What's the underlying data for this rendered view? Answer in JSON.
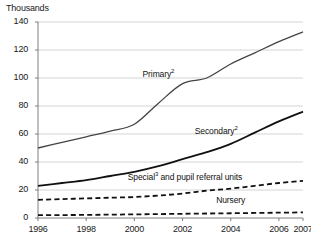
{
  "chart_data": {
    "type": "line",
    "title": "",
    "axis_note": "Thousands",
    "xlabel": "",
    "ylabel": "Thousands",
    "xlim": [
      1996,
      2007
    ],
    "ylim": [
      0,
      140
    ],
    "ytick_step": 20,
    "grid": true,
    "legend_position": "inline-annotations",
    "yticks": [
      "0",
      "20",
      "40",
      "60",
      "80",
      "100",
      "120",
      "140"
    ],
    "ytick_values": [
      0,
      20,
      40,
      60,
      80,
      100,
      120,
      140
    ],
    "xticks": [
      "1996",
      "1998",
      "2000",
      "2002",
      "2004",
      "2006",
      "2007"
    ],
    "xtick_values": [
      1996,
      1998,
      2000,
      2002,
      2004,
      2006,
      2007
    ],
    "x": [
      1996,
      1997,
      1998,
      1999,
      2000,
      2001,
      2002,
      2003,
      2004,
      2005,
      2006,
      2007
    ],
    "series": [
      {
        "name": "Primary",
        "label": "Primary",
        "footnote": "2",
        "style": "solid",
        "color": "#444444",
        "width": 1.3,
        "values": [
          50,
          54,
          58,
          62,
          67,
          82,
          96,
          100,
          110,
          118,
          126,
          133
        ]
      },
      {
        "name": "Secondary",
        "label": "Secondary",
        "footnote": "2",
        "style": "solid",
        "color": "#111111",
        "width": 1.8,
        "values": [
          23,
          25,
          27,
          30,
          33,
          37,
          42,
          47,
          53,
          61,
          69,
          76
        ]
      },
      {
        "name": "Special and pupil referral units",
        "label": "Special",
        "footnote": "3",
        "label_suffix": " and pupil referral units",
        "style": "dashed",
        "color": "#111111",
        "width": 1.8,
        "values": [
          13,
          13.5,
          14,
          14.5,
          15,
          16,
          17.5,
          19.5,
          21,
          23,
          25,
          26.5
        ]
      },
      {
        "name": "Nursery",
        "label": "Nursery",
        "footnote": "",
        "style": "dashed",
        "color": "#111111",
        "width": 1.8,
        "values": [
          2,
          2.1,
          2.2,
          2.4,
          2.6,
          2.8,
          3,
          3.2,
          3.4,
          3.6,
          3.8,
          4
        ]
      }
    ],
    "annotations": [
      {
        "text": "Primary",
        "footnote": "2",
        "x": 2001.0,
        "y": 103
      },
      {
        "text": "Secondary",
        "footnote": "2",
        "x": 2003.4,
        "y": 62
      },
      {
        "text": "Special",
        "footnote": "3",
        "suffix": " and pupil referral units",
        "x": 2002.1,
        "y": 29
      },
      {
        "text": "Nursery",
        "footnote": "",
        "x": 2004.0,
        "y": 12
      }
    ],
    "colors": {
      "grid": "#c9c9c9",
      "axis": "#6f6f6f",
      "text": "#1a1a1a",
      "primary_line": "#444444",
      "other_line": "#111111",
      "background": "#ffffff"
    }
  }
}
